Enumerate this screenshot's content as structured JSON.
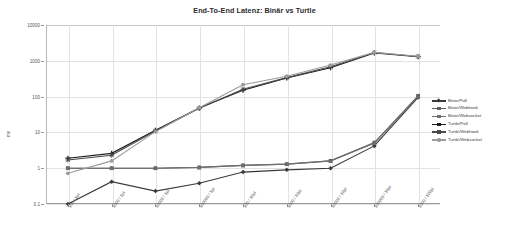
{
  "chart_data": {
    "type": "line",
    "title": "End-To-End Latenz: Binär vs Turtle",
    "xlabel": "",
    "ylabel": "ms",
    "yscale": "log",
    "ylim": [
      0.1,
      10000
    ],
    "yticks": [
      "10000",
      "1000",
      "100",
      "10",
      "1",
      "0.1"
    ],
    "grid": true,
    "legend_position": "right",
    "categories": [
      "100 / 1pt",
      "1000 / 1pt",
      "10000 / 1pt",
      "100000 / 1pt",
      "100 / 10pt",
      "1000 / 10pt",
      "10000 / 10pt",
      "100000 / 10pt",
      "1000 / 100pt"
    ],
    "series": [
      {
        "name": "Binär/Poll",
        "color": "#3a3a3a",
        "marker": "diamond",
        "values": [
          0.1,
          0.42,
          0.23,
          0.38,
          0.78,
          0.9,
          1.0,
          4.2,
          95
        ]
      },
      {
        "name": "Binär/Webhook",
        "color": "#5e5e5e",
        "marker": "square",
        "values": [
          1.0,
          1.0,
          1.0,
          1.05,
          1.2,
          1.3,
          1.6,
          5.2,
          105
        ]
      },
      {
        "name": "Binär/Websocket",
        "color": "#6f6f6f",
        "marker": "triangle",
        "values": [
          1.0,
          1.0,
          1.0,
          1.05,
          1.2,
          1.3,
          1.6,
          5.0,
          102
        ]
      },
      {
        "name": "Turtle/Poll",
        "color": "#1c1c1c",
        "marker": "cross",
        "values": [
          1.9,
          2.6,
          11.5,
          48,
          150,
          330,
          640,
          1650,
          1300
        ]
      },
      {
        "name": "Turtle/Webhook",
        "color": "#4a4a4a",
        "marker": "star",
        "values": [
          1.7,
          2.3,
          11.0,
          47,
          160,
          340,
          680,
          1700,
          1320
        ]
      },
      {
        "name": "Turtle/Websocket",
        "color": "#9b9b9b",
        "marker": "circle",
        "values": [
          0.72,
          1.6,
          10.5,
          49,
          215,
          370,
          760,
          1720,
          1340
        ]
      }
    ]
  }
}
